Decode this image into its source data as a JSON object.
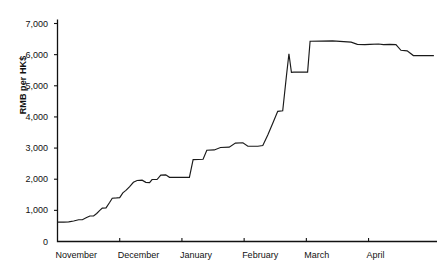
{
  "chart_data": {
    "type": "line",
    "title": "",
    "xlabel": "",
    "ylabel": "RMB per HK$",
    "ylim": [
      0,
      7000
    ],
    "ytick_labels": [
      "0",
      "1,000",
      "2,000",
      "3,000",
      "4,000",
      "5,000",
      "6,000",
      "7,000"
    ],
    "ytick_values": [
      0,
      1000,
      2000,
      3000,
      4000,
      5000,
      6000,
      7000
    ],
    "categories": [
      "November",
      "December",
      "January",
      "February",
      "March",
      "April"
    ],
    "xtick_values": [
      0,
      1,
      2,
      3,
      4,
      5
    ],
    "xlim": [
      0,
      6.1
    ],
    "grid": false,
    "legend": false,
    "series": [
      {
        "name": "RMB per HK$",
        "points": [
          [
            0.0,
            620
          ],
          [
            0.1,
            620
          ],
          [
            0.18,
            630
          ],
          [
            0.26,
            660
          ],
          [
            0.34,
            700
          ],
          [
            0.4,
            700
          ],
          [
            0.46,
            760
          ],
          [
            0.52,
            820
          ],
          [
            0.58,
            820
          ],
          [
            0.63,
            900
          ],
          [
            0.68,
            1000
          ],
          [
            0.72,
            1070
          ],
          [
            0.78,
            1080
          ],
          [
            0.84,
            1260
          ],
          [
            0.88,
            1390
          ],
          [
            0.95,
            1400
          ],
          [
            1.0,
            1410
          ],
          [
            1.05,
            1560
          ],
          [
            1.1,
            1640
          ],
          [
            1.16,
            1760
          ],
          [
            1.22,
            1900
          ],
          [
            1.28,
            1960
          ],
          [
            1.36,
            1970
          ],
          [
            1.42,
            1900
          ],
          [
            1.48,
            1890
          ],
          [
            1.52,
            1990
          ],
          [
            1.6,
            1990
          ],
          [
            1.66,
            2130
          ],
          [
            1.74,
            2140
          ],
          [
            1.8,
            2060
          ],
          [
            2.05,
            2060
          ],
          [
            2.12,
            2060
          ],
          [
            2.18,
            2630
          ],
          [
            2.34,
            2640
          ],
          [
            2.4,
            2930
          ],
          [
            2.52,
            2940
          ],
          [
            2.62,
            3020
          ],
          [
            2.76,
            3030
          ],
          [
            2.86,
            3160
          ],
          [
            2.98,
            3170
          ],
          [
            3.06,
            3060
          ],
          [
            3.22,
            3060
          ],
          [
            3.3,
            3080
          ],
          [
            3.38,
            3420
          ],
          [
            3.46,
            3800
          ],
          [
            3.54,
            4180
          ],
          [
            3.62,
            4200
          ],
          [
            3.68,
            5320
          ],
          [
            3.72,
            6030
          ],
          [
            3.76,
            5430
          ],
          [
            3.8,
            5440
          ],
          [
            3.96,
            5440
          ],
          [
            4.02,
            5440
          ],
          [
            4.06,
            6430
          ],
          [
            4.42,
            6440
          ],
          [
            4.6,
            6420
          ],
          [
            4.72,
            6400
          ],
          [
            4.82,
            6330
          ],
          [
            4.94,
            6320
          ],
          [
            5.02,
            6330
          ],
          [
            5.16,
            6340
          ],
          [
            5.24,
            6320
          ],
          [
            5.34,
            6330
          ],
          [
            5.44,
            6320
          ],
          [
            5.52,
            6140
          ],
          [
            5.62,
            6120
          ],
          [
            5.72,
            5970
          ],
          [
            6.05,
            5970
          ]
        ]
      }
    ]
  }
}
